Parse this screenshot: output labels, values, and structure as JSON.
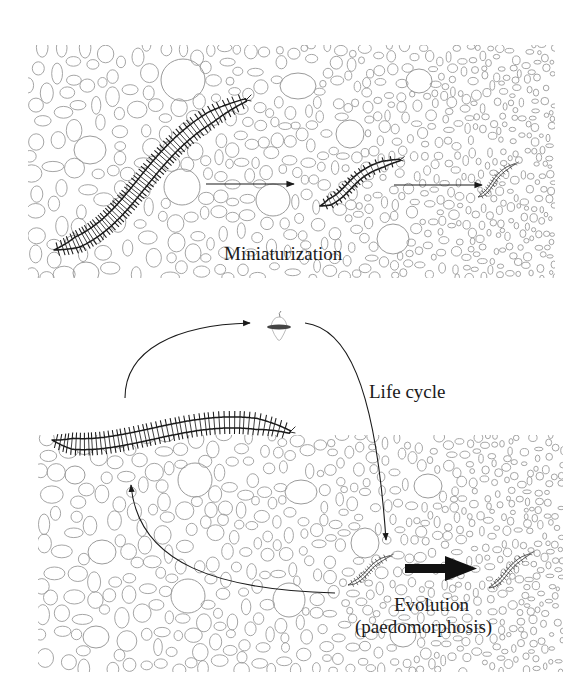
{
  "figure": {
    "type": "schematic diagram",
    "background": "#ffffff",
    "grain_outline_color": "#9b9b9b",
    "ink_color": "#1a1a1a"
  },
  "top_panel": {
    "name": "miniaturization-panel",
    "bounds": {
      "x": 28,
      "y": 45,
      "w": 527,
      "h": 233
    },
    "label": "Miniaturization",
    "organisms": [
      {
        "name": "large-worm",
        "size": "large"
      },
      {
        "name": "medium-worm",
        "size": "medium"
      },
      {
        "name": "small-worm",
        "size": "small"
      }
    ],
    "arrows": [
      {
        "name": "arrow-large-to-medium",
        "style": "thin"
      },
      {
        "name": "arrow-medium-to-small",
        "style": "thin"
      }
    ]
  },
  "bottom_panel": {
    "name": "paedomorphosis-panel",
    "bounds": {
      "x": 38,
      "y": 435,
      "w": 525,
      "h": 237
    },
    "labels": {
      "life_cycle": "Life cycle",
      "evolution_line1": "Evolution",
      "evolution_line2": "(paedomorphosis)"
    },
    "organisms": [
      {
        "name": "adult-worm",
        "size": "large"
      },
      {
        "name": "planktonic-larva",
        "size": "tiny"
      },
      {
        "name": "juvenile-worm",
        "size": "small"
      },
      {
        "name": "paedomorphic-worm",
        "size": "small"
      }
    ],
    "arrows": [
      {
        "name": "arrow-adult-to-larva",
        "style": "thin-curved"
      },
      {
        "name": "arrow-larva-to-juvenile",
        "style": "thin-curved",
        "label": "Life cycle"
      },
      {
        "name": "arrow-juvenile-to-adult",
        "style": "thin-curved"
      },
      {
        "name": "arrow-evolution",
        "style": "thick",
        "label": "Evolution (paedomorphosis)"
      }
    ]
  }
}
